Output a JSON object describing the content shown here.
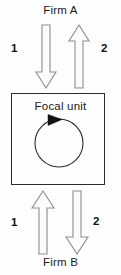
{
  "diagram": {
    "title_top": "Firm A",
    "title_bottom": "Firm B",
    "center_label": "Focal unit",
    "flow_numbers": {
      "top_left": "1",
      "top_right": "2",
      "bottom_left": "1",
      "bottom_right": "2"
    },
    "arrows": {
      "top_left": "down-arrow",
      "top_right": "up-arrow",
      "bottom_left": "up-arrow",
      "bottom_right": "down-arrow",
      "center": "clockwise-circular-arrow"
    },
    "colors": {
      "background": "#fdfdfd",
      "box_border": "#2b2b2b",
      "arrow_fill": "#fcfcfc",
      "arrow_stroke": "#8d8d8d",
      "cycle_stroke": "#2b2b2b",
      "cycle_head_fill": "#111111",
      "text": "#1a1a1a"
    }
  }
}
